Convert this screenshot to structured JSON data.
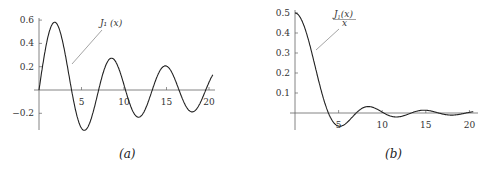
{
  "chart_data": [
    {
      "type": "line",
      "panel": "a",
      "caption": "(a)",
      "title": "",
      "xlabel": "",
      "ylabel": "",
      "annotation": "J₁ (x)",
      "x_ticks": [
        5,
        10,
        15,
        20
      ],
      "x_tick_labels": [
        "5",
        "10",
        "15",
        "20"
      ],
      "y_ticks": [
        0.6,
        0.4,
        0.2,
        -0.2
      ],
      "y_tick_labels": [
        "0.6",
        "0.4",
        "0.2",
        "−0.2"
      ],
      "xlim": [
        0,
        20.5
      ],
      "ylim": [
        -0.35,
        0.65
      ],
      "grid": false,
      "series": [
        {
          "name": "J1(x)",
          "function": "J1",
          "x": [
            0,
            1,
            1.84,
            3,
            3.83,
            5,
            5.33,
            6,
            7,
            7.02,
            8,
            8.54,
            9,
            10,
            10.17,
            11,
            11.71,
            12,
            13,
            13.32,
            14,
            14.86,
            15,
            16,
            16.47,
            17,
            18,
            18.02,
            19,
            19.62,
            20,
            20.5
          ],
          "y": [
            0,
            0.44,
            0.582,
            0.339,
            0,
            -0.328,
            -0.346,
            -0.277,
            -0.005,
            0,
            0.235,
            0.273,
            0.245,
            0.043,
            0,
            -0.177,
            -0.223,
            -0.223,
            -0.07,
            0,
            0.133,
            0.207,
            0.205,
            0.09,
            0,
            -0.098,
            -0.188,
            -0.188,
            -0.106,
            0,
            0.067,
            0.125
          ]
        }
      ]
    },
    {
      "type": "line",
      "panel": "b",
      "caption": "(b)",
      "title": "",
      "xlabel": "",
      "ylabel": "",
      "annotation": "J₁(x) / x",
      "x_ticks": [
        5,
        10,
        15,
        20
      ],
      "x_tick_labels": [
        "5",
        "10",
        "15",
        "20"
      ],
      "y_ticks": [
        0.5,
        0.4,
        0.3,
        0.2,
        0.1
      ],
      "y_tick_labels": [
        "0.5",
        "0.4",
        "0.3",
        "0.2",
        "0.1"
      ],
      "xlim": [
        0,
        20.5
      ],
      "ylim": [
        -0.07,
        0.52
      ],
      "grid": false,
      "series": [
        {
          "name": "J1(x)/x",
          "function": "J1_over_x",
          "x": [
            0,
            1,
            2,
            3,
            3.83,
            5,
            5.14,
            6,
            7,
            7.02,
            8,
            8.42,
            9,
            10,
            10.17,
            11,
            11.62,
            12,
            13,
            13.32,
            14,
            14.8,
            15,
            16,
            16.47,
            17,
            18,
            18.02,
            19,
            19.62,
            20,
            20.5
          ],
          "y": [
            0.5,
            0.44,
            0.288,
            0.113,
            0,
            -0.066,
            -0.068,
            -0.046,
            -0.001,
            0,
            0.029,
            0.033,
            0.027,
            0.004,
            0,
            -0.016,
            -0.019,
            -0.019,
            -0.005,
            0,
            0.0095,
            0.014,
            0.0137,
            0.0056,
            0,
            -0.0058,
            -0.0104,
            -0.0104,
            -0.0056,
            0,
            0.0033,
            0.006
          ]
        }
      ]
    }
  ],
  "captions": {
    "a": "(a)",
    "b": "(b)"
  }
}
